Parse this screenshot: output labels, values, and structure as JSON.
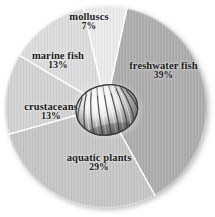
{
  "chart_data": {
    "type": "pie",
    "title": "",
    "subtitle": "",
    "xlabel": "",
    "ylabel": "",
    "legend_position": "none",
    "grid": false,
    "units": "percent",
    "total": 101,
    "start_angle_deg": 12,
    "direction": "clockwise",
    "center_decoration": "clam-shell-photo",
    "categories": [
      "freshwater fish",
      "aquatic plants",
      "crustaceans",
      "marine fish",
      "molluscs"
    ],
    "values": [
      39,
      29,
      13,
      13,
      7
    ],
    "slices": [
      {
        "id": "freshwater-fish",
        "label": "freshwater fish",
        "value": 39,
        "percent_text": "39%",
        "color": "#adadad",
        "start_deg": 12,
        "end_deg": 152.4
      },
      {
        "id": "aquatic-plants",
        "label": "aquatic plants",
        "value": 29,
        "percent_text": "29%",
        "color": "#c6c6c6",
        "start_deg": 152.4,
        "end_deg": 256.8
      },
      {
        "id": "crustaceans",
        "label": "crustaceans",
        "value": 13,
        "percent_text": "13%",
        "color": "#d2d2d2",
        "start_deg": 256.8,
        "end_deg": 303.6
      },
      {
        "id": "marine-fish",
        "label": "marine fish",
        "value": 13,
        "percent_text": "13%",
        "color": "#dcdcdc",
        "start_deg": 303.6,
        "end_deg": 350.4
      },
      {
        "id": "molluscs",
        "label": "molluscs",
        "value": 7,
        "percent_text": "7%",
        "color": "#ebebeb",
        "start_deg": 350.4,
        "end_deg": 372
      }
    ]
  },
  "labels": {
    "molluscs": {
      "category": "molluscs",
      "percent": "7%"
    },
    "freshwater_fish": {
      "category": "freshwater fish",
      "percent": "39%"
    },
    "marine_fish": {
      "category": "marine fish",
      "percent": "13%"
    },
    "crustaceans": {
      "category": "crustaceans",
      "percent": "13%"
    },
    "aquatic_plants": {
      "category": "aquatic plants",
      "percent": "29%"
    }
  },
  "style": {
    "background": "#ffffff",
    "separator_color": "#ffffff",
    "label_color": "#1b1b1b",
    "shadow_color": "rgba(120,120,120,0.45)"
  }
}
